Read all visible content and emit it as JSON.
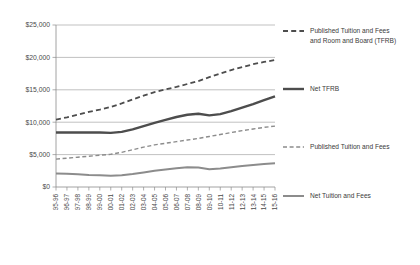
{
  "chart_data": {
    "type": "line",
    "title": "",
    "xlabel": "",
    "ylabel": "",
    "ylim": [
      0,
      25000
    ],
    "ytick_values": [
      0,
      5000,
      10000,
      15000,
      20000,
      25000
    ],
    "ytick_labels": [
      "$0",
      "$5,000",
      "$10,000",
      "$15,000",
      "$20,000",
      "$25,000"
    ],
    "grid": true,
    "legend_position": "right",
    "categories": [
      "95-96",
      "96-97",
      "97-98",
      "98-99",
      "99-00",
      "00-01",
      "01-02",
      "02-03",
      "03-04",
      "04-05",
      "05-06",
      "06-07",
      "07-08",
      "08-09",
      "09-10",
      "10-11",
      "11-12",
      "12-13",
      "13-14",
      "14-15",
      "15-16"
    ],
    "series": [
      {
        "name": "Published Tuition and Fees and Room and Board (TFRB)",
        "style": "dashed",
        "color": "#4d4d4d",
        "width": 1.8,
        "values": [
          10400,
          10750,
          11150,
          11600,
          11950,
          12350,
          12900,
          13500,
          14100,
          14650,
          15050,
          15450,
          15900,
          16350,
          16950,
          17500,
          18050,
          18500,
          18950,
          19300,
          19600
        ]
      },
      {
        "name": "Net TFRB",
        "style": "solid",
        "color": "#4d4d4d",
        "width": 2.4,
        "values": [
          8400,
          8400,
          8400,
          8400,
          8400,
          8350,
          8500,
          8900,
          9400,
          9900,
          10350,
          10800,
          11150,
          11300,
          11050,
          11250,
          11700,
          12250,
          12800,
          13400,
          14000
        ]
      },
      {
        "name": "Published Tuition and Fees",
        "style": "dashed",
        "color": "#8c8c8c",
        "width": 1.4,
        "values": [
          4300,
          4450,
          4600,
          4750,
          4900,
          5050,
          5350,
          5750,
          6150,
          6500,
          6750,
          7000,
          7250,
          7500,
          7800,
          8100,
          8400,
          8700,
          8950,
          9200,
          9400
        ]
      },
      {
        "name": "Net Tuition and Fees",
        "style": "solid",
        "color": "#8c8c8c",
        "width": 2.0,
        "values": [
          2100,
          2050,
          1950,
          1850,
          1800,
          1750,
          1800,
          2000,
          2250,
          2500,
          2700,
          2900,
          3050,
          3000,
          2750,
          2850,
          3050,
          3250,
          3400,
          3550,
          3650
        ]
      }
    ],
    "legend_entries": [
      {
        "label_lines": [
          "Published Tuition and Fees",
          "and Room and Board (TFRB)"
        ],
        "style": "dashed",
        "color": "#4d4d4d",
        "width": 1.8
      },
      {
        "label_lines": [
          "Net TFRB"
        ],
        "style": "solid",
        "color": "#4d4d4d",
        "width": 2.4
      },
      {
        "label_lines": [
          "Published Tuition and Fees"
        ],
        "style": "dashed",
        "color": "#8c8c8c",
        "width": 1.4
      },
      {
        "label_lines": [
          "Net Tuition and Fees"
        ],
        "style": "solid",
        "color": "#8c8c8c",
        "width": 2.0
      }
    ]
  }
}
